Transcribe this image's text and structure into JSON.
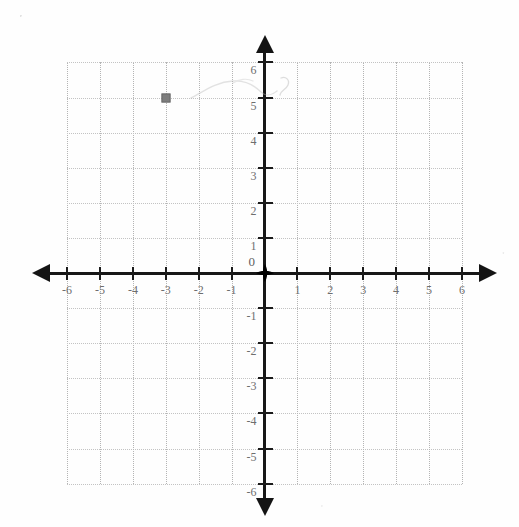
{
  "figure": {
    "title": "",
    "background_color": "#ffffff",
    "axis_color": "#141414",
    "grid_color": "#c9c9c9",
    "label_color": "#6e6e6e",
    "marker_color": "#7e7e7e"
  },
  "chart_data": {
    "type": "scatter",
    "title": "",
    "xlabel": "",
    "ylabel": "",
    "xlim": [
      -6,
      6
    ],
    "ylim": [
      -6,
      6
    ],
    "grid": true,
    "legend": "none",
    "x_ticks": [
      -6,
      -5,
      -4,
      -3,
      -2,
      -1,
      1,
      2,
      3,
      4,
      5,
      6
    ],
    "y_ticks": [
      6,
      5,
      4,
      3,
      2,
      1,
      -1,
      -2,
      -3,
      -4,
      -5,
      -6
    ],
    "x_tick_labels": [
      "-6",
      "-5",
      "-4",
      "-3",
      "-2",
      "-1",
      "1",
      "2",
      "3",
      "4",
      "5",
      "6"
    ],
    "y_tick_labels": [
      "6",
      "5",
      "4",
      "3",
      "2",
      "1",
      "-1",
      "-2",
      "-3",
      "-4",
      "-5",
      "-6"
    ],
    "origin_label": "0",
    "points": [
      {
        "label": "",
        "x": -3,
        "y": 5
      }
    ],
    "annotations": [
      {
        "name": "pencil-scribble",
        "note": "faint erased pencil mark",
        "x_start": -2.3,
        "x_end": -0.3,
        "y": 5.1
      }
    ]
  }
}
